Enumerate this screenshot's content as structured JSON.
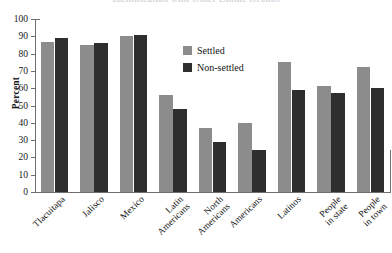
{
  "chart_data": {
    "type": "bar",
    "title": "Identification with Other Ethnic Groups",
    "xlabel": "",
    "ylabel": "Percent",
    "ylim": [
      0,
      100
    ],
    "ytick_step": 10,
    "yticks": [
      100,
      90,
      80,
      70,
      60,
      50,
      40,
      30,
      20,
      10,
      0
    ],
    "grid": false,
    "legend_position": "upper-center",
    "categories": [
      "Tlacuitapa",
      "Jalisco",
      "Mexico",
      "Latin\nAmericans",
      "North\nAmericans",
      "Americans",
      "Latinos",
      "People\nin state",
      "People\nin town"
    ],
    "series": [
      {
        "name": "Settled",
        "color": "#8c8c8c",
        "values": [
          87,
          85,
          90,
          56,
          37,
          40,
          75,
          61,
          72
        ]
      },
      {
        "name": "Non-settled",
        "color": "#2e2e2e",
        "values": [
          89,
          86,
          91,
          48,
          29,
          24,
          59,
          57,
          60
        ]
      }
    ]
  },
  "legend": {
    "items": [
      {
        "label": "Settled",
        "swatch": "settled"
      },
      {
        "label": "Non-settled",
        "swatch": "nonsettled"
      }
    ]
  }
}
